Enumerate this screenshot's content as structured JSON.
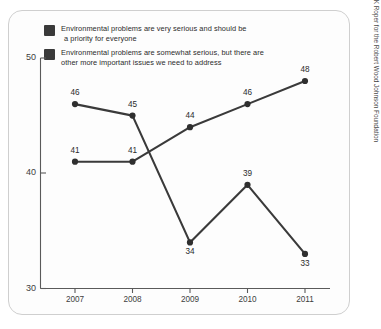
{
  "legend": {
    "items": [
      {
        "swatch_color": "#3a3a3a",
        "icon": "legend-swatch-square",
        "line1": "Environmental problems are very serious and should be",
        "line2": "a priority for everyone"
      },
      {
        "swatch_color": "#3a3a3a",
        "icon": "legend-swatch-square",
        "line1": "Environmental problems are somewhat serious, but there are",
        "line2": "other more important issues we need to address"
      }
    ]
  },
  "source": {
    "text": "Source: GfK Roper for the Robert Wood Johnson Foundation"
  },
  "axes": {
    "y_ticks": [
      "50",
      "40",
      "30"
    ],
    "x_ticks": [
      "2007",
      "2008",
      "2009",
      "2010",
      "2011"
    ]
  },
  "colors": {
    "line": "#3a3a3a",
    "marker": "#2f2f2f",
    "axis": "#5a5a5a",
    "card_bg": "#fdfdfd",
    "card_border": "#cfcfcf",
    "text": "#2b2b2b"
  },
  "chart_data": {
    "type": "line",
    "title": "",
    "subtitle": "",
    "xlabel": "",
    "ylabel": "",
    "x": [
      "2007",
      "2008",
      "2009",
      "2010",
      "2011"
    ],
    "categories": [
      "2007",
      "2008",
      "2009",
      "2010",
      "2011"
    ],
    "ylim": [
      30,
      50
    ],
    "yticks": [
      30,
      40,
      50
    ],
    "grid": false,
    "legend_position": "top-left",
    "series": [
      {
        "name": "Environmental problems are very serious and should be a priority for everyone",
        "values": [
          46,
          45,
          34,
          39,
          33
        ],
        "labels": [
          "46",
          "45",
          "34",
          "39",
          "33"
        ],
        "label_positions": [
          "above",
          "above",
          "below",
          "above",
          "below"
        ],
        "color": "#3a3a3a"
      },
      {
        "name": "Environmental problems are somewhat serious, but there are other more important issues we need to address",
        "values": [
          41,
          41,
          44,
          46,
          48
        ],
        "labels": [
          "41",
          "41",
          "44",
          "46",
          "48"
        ],
        "label_positions": [
          "above",
          "above",
          "above",
          "above",
          "above"
        ],
        "color": "#3a3a3a"
      }
    ]
  }
}
